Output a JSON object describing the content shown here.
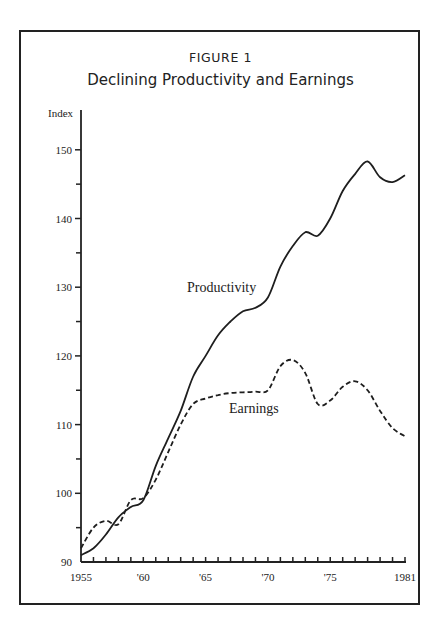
{
  "figure": {
    "label": "FIGURE 1",
    "title": "Declining Productivity and Earnings"
  },
  "axes": {
    "y_label": "Index",
    "y_ticks": [
      "150",
      "140",
      "130",
      "120",
      "110",
      "100",
      "90"
    ],
    "x_ticks": [
      "1955",
      "'60",
      "'65",
      "'70",
      "'75",
      "1981"
    ]
  },
  "series_labels": {
    "productivity": "Productivity",
    "earnings": "Earnings"
  },
  "chart_data": {
    "type": "line",
    "title": "Declining Productivity and Earnings",
    "subtitle": "FIGURE 1",
    "xlabel": "",
    "ylabel": "Index",
    "x": [
      1955,
      1956,
      1957,
      1958,
      1959,
      1960,
      1961,
      1962,
      1963,
      1964,
      1965,
      1966,
      1967,
      1968,
      1969,
      1970,
      1971,
      1972,
      1973,
      1974,
      1975,
      1976,
      1977,
      1978,
      1979,
      1980,
      1981
    ],
    "x_tick_labels": [
      "1955",
      "'60",
      "'65",
      "'70",
      "'75",
      "1981"
    ],
    "ylim": [
      90,
      152
    ],
    "xlim": [
      1955,
      1981
    ],
    "y_ticks": [
      90,
      100,
      110,
      120,
      130,
      140,
      150
    ],
    "grid": false,
    "legend": "inline labels",
    "series": [
      {
        "name": "Productivity",
        "style": "solid",
        "values": [
          91,
          92,
          94,
          96.5,
          98,
          99,
          104,
          108,
          112,
          117,
          120,
          123,
          125,
          126.5,
          127,
          128.5,
          133,
          136,
          138,
          137.5,
          140,
          144,
          146.5,
          148.3,
          146,
          145.3,
          146.3
        ]
      },
      {
        "name": "Earnings",
        "style": "dashed",
        "values": [
          92,
          95,
          96,
          95.5,
          99,
          99.3,
          102,
          106,
          110,
          113,
          113.8,
          114.3,
          114.6,
          114.7,
          114.8,
          115,
          118.5,
          119.4,
          117.5,
          113,
          113.5,
          115.5,
          116.3,
          115,
          112,
          109.5,
          108.3
        ]
      }
    ]
  }
}
